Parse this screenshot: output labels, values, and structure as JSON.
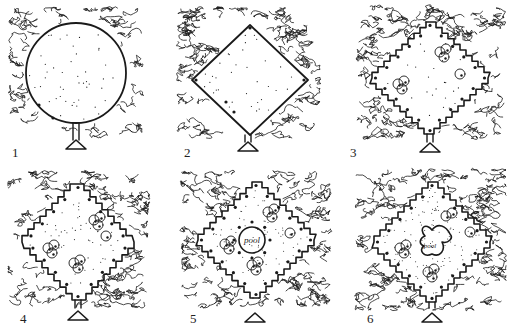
{
  "figure": {
    "ink_color": "#1a1a1a",
    "background": "#ffffff",
    "panels": [
      {
        "label": "1",
        "clearing_shape": "circle",
        "entrance": "triangle",
        "features": [
          "dense woodland texture",
          "stippled ground",
          "two dots near lower-left edge"
        ]
      },
      {
        "label": "2",
        "clearing_shape": "diamond",
        "entrance": "triangle",
        "features": [
          "dense woodland texture",
          "stippled ground",
          "dots at corners and edges"
        ]
      },
      {
        "label": "3",
        "clearing_shape": "stepped diamond",
        "entrance": "triangle",
        "features": [
          "stepped edges",
          "dotted edge line",
          "tree clusters"
        ]
      },
      {
        "label": "4",
        "clearing_shape": "stepped diamond",
        "entrance": "triangle",
        "features": [
          "fully stepped edges",
          "dotted edge line",
          "four tree clusters"
        ]
      },
      {
        "label": "5",
        "clearing_shape": "stepped diamond",
        "entrance": "triangle",
        "features": [
          "central circular pool",
          "dots around pool",
          "tree clusters"
        ],
        "pool_label": "pool"
      },
      {
        "label": "6",
        "clearing_shape": "stepped diamond",
        "entrance": "triangle",
        "features": [
          "freeform central pool",
          "tree clusters",
          "dense stippling"
        ],
        "pool_label": "pool"
      }
    ]
  }
}
